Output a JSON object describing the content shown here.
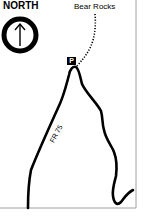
{
  "compass": {
    "label": "NORTH",
    "icon": "north-arrow-icon"
  },
  "places": [
    {
      "name": "Bear Rocks",
      "type": "destination"
    }
  ],
  "markers": [
    {
      "symbol": "P",
      "meaning": "parking"
    }
  ],
  "roads": [
    {
      "label": "FR 75"
    }
  ],
  "trail": {
    "style": "dotted"
  },
  "colors": {
    "road": "#000000",
    "frame": "#a0a0a0",
    "background": "#ffffff"
  }
}
